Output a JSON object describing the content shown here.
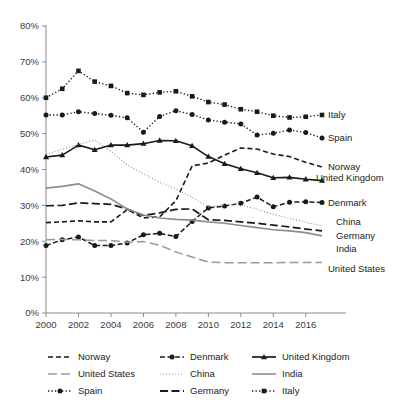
{
  "chart_data": {
    "type": "line",
    "title": "",
    "xlabel": "",
    "ylabel": "",
    "ylim": [
      0,
      80
    ],
    "xlim": [
      2000,
      2017
    ],
    "grid": false,
    "legend_position": "bottom",
    "y_ticks": [
      "0%",
      "10%",
      "20%",
      "30%",
      "40%",
      "50%",
      "60%",
      "70%",
      "80%"
    ],
    "y_tick_values": [
      0,
      10,
      20,
      30,
      40,
      50,
      60,
      70,
      80
    ],
    "x_ticks": [
      "2000",
      "2002",
      "2004",
      "2006",
      "2008",
      "2010",
      "2012",
      "2014",
      "2016"
    ],
    "x_tick_values": [
      2000,
      2002,
      2004,
      2006,
      2008,
      2010,
      2012,
      2014,
      2016
    ],
    "x": [
      2000,
      2001,
      2002,
      2003,
      2004,
      2005,
      2006,
      2007,
      2008,
      2009,
      2010,
      2011,
      2012,
      2013,
      2014,
      2015,
      2016,
      2017
    ],
    "series": [
      {
        "name": "Italy",
        "color": "#1a1a1a",
        "dash": "dotted",
        "marker": "square",
        "end_label": "Italy",
        "values": [
          60.0,
          62.5,
          67.5,
          64.5,
          63.3,
          61.3,
          60.8,
          61.5,
          61.8,
          60.4,
          58.8,
          58.1,
          56.8,
          56.1,
          55.0,
          54.5,
          54.7,
          55.2
        ]
      },
      {
        "name": "Spain",
        "color": "#1a1a1a",
        "dash": "dotted",
        "marker": "circle",
        "end_label": "Spain",
        "values": [
          55.2,
          55.2,
          56.1,
          55.6,
          55.1,
          54.4,
          50.4,
          54.8,
          56.4,
          55.3,
          53.8,
          53.2,
          52.7,
          49.6,
          50.1,
          51.0,
          50.3,
          48.8
        ]
      },
      {
        "name": "Norway",
        "color": "#1a1a1a",
        "dash": "dashed",
        "marker": "none",
        "end_label": "Norway",
        "values": [
          25.2,
          25.4,
          25.7,
          25.4,
          25.4,
          28.8,
          26.5,
          26.8,
          31.3,
          41.0,
          41.8,
          44.0,
          46.0,
          45.7,
          44.3,
          43.6,
          42.0,
          40.7
        ]
      },
      {
        "name": "United Kingdom",
        "color": "#1a1a1a",
        "dash": "solid",
        "marker": "triangle",
        "end_label": "United Kingdom",
        "values": [
          43.5,
          44.0,
          46.8,
          45.5,
          46.8,
          46.8,
          47.2,
          48.1,
          48.0,
          46.6,
          43.6,
          41.6,
          40.2,
          39.1,
          37.7,
          37.8,
          37.3,
          36.9
        ]
      },
      {
        "name": "Denmark",
        "color": "#1a1a1a",
        "dash": "dashdot",
        "marker": "circle",
        "end_label": "Denmark",
        "values": [
          18.8,
          20.4,
          21.2,
          18.8,
          18.8,
          19.5,
          21.8,
          22.2,
          21.3,
          25.5,
          29.3,
          29.8,
          30.6,
          32.3,
          29.6,
          30.9,
          31.0,
          30.8
        ]
      },
      {
        "name": "China",
        "color": "#9a9a9a",
        "dash": "fine-dotted",
        "marker": "none",
        "end_label": "China",
        "values": [
          44.2,
          45.6,
          47.0,
          48.2,
          45.0,
          41.3,
          38.8,
          36.4,
          34.6,
          32.2,
          29.6,
          30.2,
          30.1,
          28.9,
          27.5,
          26.4,
          25.3,
          24.3
        ]
      },
      {
        "name": "Germany",
        "color": "#1a1a1a",
        "dash": "long-dash",
        "marker": "none",
        "end_label": "Germany",
        "values": [
          29.9,
          30.0,
          30.7,
          30.5,
          30.3,
          29.0,
          27.2,
          27.9,
          28.9,
          29.0,
          26.0,
          25.8,
          25.4,
          25.0,
          24.5,
          24.0,
          23.4,
          22.9
        ]
      },
      {
        "name": "India",
        "color": "#8d8d8d",
        "dash": "solid",
        "marker": "none",
        "end_label": "India",
        "values": [
          34.8,
          35.3,
          36.0,
          34.0,
          31.8,
          29.0,
          27.3,
          26.5,
          26.1,
          25.9,
          25.4,
          25.0,
          24.4,
          23.8,
          23.2,
          22.9,
          22.4,
          21.5
        ]
      },
      {
        "name": "United States",
        "color": "#9a9a9a",
        "dash": "dashdot-gray",
        "marker": "none",
        "end_label": "United States",
        "values": [
          20.4,
          20.5,
          20.4,
          20.2,
          20.2,
          19.7,
          19.9,
          18.9,
          17.0,
          15.6,
          14.2,
          14.0,
          14.0,
          14.0,
          14.0,
          14.1,
          14.1,
          14.1
        ]
      }
    ],
    "legend": [
      {
        "label": "Norway",
        "style": "dashed"
      },
      {
        "label": "Denmark",
        "style": "dashdot-marker-circle"
      },
      {
        "label": "United Kingdom",
        "style": "solid-marker-triangle"
      },
      {
        "label": "United States",
        "style": "dashdot-gray"
      },
      {
        "label": "China",
        "style": "fine-dotted"
      },
      {
        "label": "India",
        "style": "solid-gray"
      },
      {
        "label": "Spain",
        "style": "dotted-marker-circle"
      },
      {
        "label": "Germany",
        "style": "long-dash"
      },
      {
        "label": "Italy",
        "style": "dotted-marker-square"
      }
    ]
  }
}
